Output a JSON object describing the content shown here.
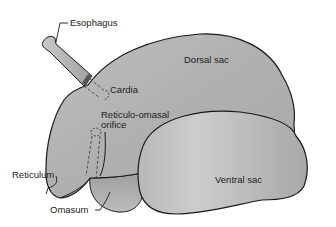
{
  "diagram": {
    "labels": {
      "esophagus": "Esophagus",
      "cardia": "Cardia",
      "dorsal_sac": "Dorsal sac",
      "reticulo_omasal_line1": "Reticulo-omasal",
      "reticulo_omasal_line2": "orifice",
      "reticulum": "Reticulum",
      "ventral_sac": "Ventral sac",
      "omasum": "Omasum"
    },
    "colors": {
      "organ_fill": "#b4b4b4",
      "organ_fill_light": "#cfcfcf",
      "outline": "#1a1a1a",
      "background": "#ffffff"
    }
  }
}
